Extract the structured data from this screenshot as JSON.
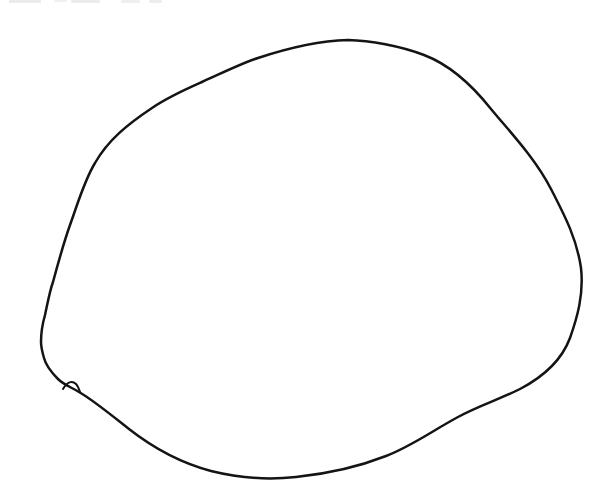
{
  "page": {
    "background_color": "#ffffff"
  },
  "drawing": {
    "description": "Freehand black-ink outline of a large closed oval shape drawn on a white scanned page, with a small pen kink at the lower left where the stroke begins and ends",
    "ink_color": "#141414",
    "stroke_width": 2.5,
    "outline_path": "M 348,40 C 370,40.5 400,46 424,55 C 449,64.5 472,85 491,109 C 510,132 535,158 551,189 C 566,218 577,240 581,268 C 584,295 577,318 570,338 C 561,362 543,377 520,389 C 498,400 478,406 458,417 C 432,431 412,446 386,456 C 358,467 325,474 296,477 C 268,480 239,478 211,471 C 181,463 152,447 129,429 C 110,414 93,400 79,392 C 71,387 64,385 58,379 C 51,372 46,366 44,358 C 42,351 41,347 41,342 C 41,329 43,322 45,315 C 48,301 50,290 53,282 C 60,256 64,242 70,225 C 77,206 84,181 95,163 C 108,140 128,124 152,108 C 168,97 184,90 202,82 C 220,74 240,64 258,58 C 285,49 315,41 348,40 Z",
    "kink_path": "M 63,389 C 67,382 72,380 76,384 C 78,386 79,389 80,392"
  }
}
